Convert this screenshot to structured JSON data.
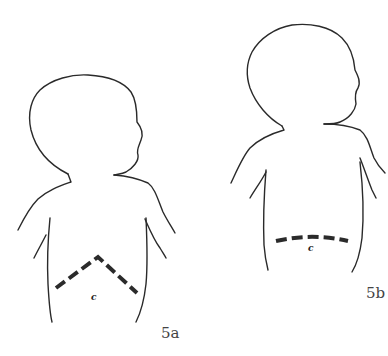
{
  "figures": [
    {
      "id": "5a",
      "label": "5a",
      "incision_type": "chevron",
      "incision_mark": "c"
    },
    {
      "id": "5b",
      "label": "5b",
      "incision_type": "transverse",
      "incision_mark": "c"
    }
  ],
  "colors": {
    "line": "#2a2a2a",
    "background": "#ffffff",
    "label": "#444444"
  }
}
